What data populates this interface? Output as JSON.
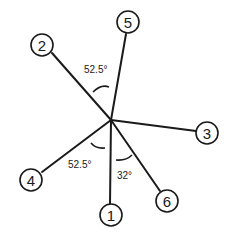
{
  "diagram": {
    "center": {
      "x": 111,
      "y": 120
    },
    "nodes": [
      {
        "label": "1",
        "x": 111,
        "y": 215
      },
      {
        "label": "2",
        "x": 42,
        "y": 45
      },
      {
        "label": "3",
        "x": 207,
        "y": 133
      },
      {
        "label": "4",
        "x": 31,
        "y": 180
      },
      {
        "label": "5",
        "x": 128,
        "y": 22
      },
      {
        "label": "6",
        "x": 167,
        "y": 201
      }
    ],
    "angles": [
      {
        "label": "52.5°",
        "between": [
          "2",
          "5"
        ]
      },
      {
        "label": "52.5°",
        "between": [
          "4",
          "1"
        ]
      },
      {
        "label": "32°",
        "between": [
          "1",
          "6"
        ]
      }
    ]
  }
}
